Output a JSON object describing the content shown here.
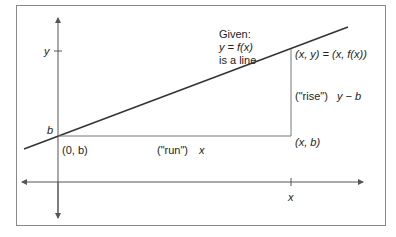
{
  "diagram": {
    "title_block": [
      "Given:",
      "y = f(x)",
      "is a line"
    ],
    "labels": {
      "y_axis_tick": "y",
      "intercept": "b",
      "origin_point": "(0, b)",
      "run": "(\"run\")",
      "run_value": "x",
      "rise": "(\"rise\")",
      "rise_value": "y − b",
      "point": "(x, y) = (x, f(x))",
      "corner_point": "(x, b)",
      "x_axis_tick": "x"
    },
    "colors": {
      "line": "#333333",
      "axis": "#555555",
      "frame": "#888888"
    }
  }
}
